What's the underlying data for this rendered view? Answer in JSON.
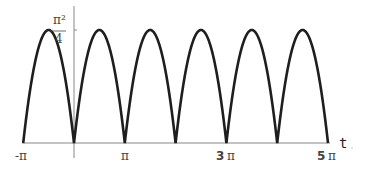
{
  "chart_data": {
    "type": "line",
    "title": "",
    "function": "periodic arches with zeros at integer multiples of pi",
    "xlabel": "t",
    "ylabel": "",
    "xlim": [
      -3.14159,
      15.70796
    ],
    "ylim": [
      0,
      2.4674
    ],
    "x_ticks": [
      {
        "value": -3.14159,
        "label": "-π"
      },
      {
        "value": 3.14159,
        "label": "π"
      },
      {
        "value": 9.42478,
        "label": "3 π"
      },
      {
        "value": 15.70796,
        "label": "5 π"
      }
    ],
    "y_ticks": [
      {
        "value": 2.4674,
        "label_num": "π²",
        "label_den": "4"
      }
    ],
    "series": [
      {
        "name": "f(t)",
        "color": "#222222",
        "zeros": [
          -3.14159,
          0,
          3.14159,
          6.28319,
          9.42478,
          12.56637,
          15.70796
        ],
        "peaks": [
          {
            "x": -1.5708,
            "y": 2.4674
          },
          {
            "x": 1.5708,
            "y": 2.4674
          },
          {
            "x": 4.7124,
            "y": 2.4674
          },
          {
            "x": 7.854,
            "y": 2.4674
          },
          {
            "x": 10.9956,
            "y": 2.4674
          },
          {
            "x": 14.1372,
            "y": 2.4674
          }
        ]
      }
    ],
    "grid": false,
    "legend": null
  },
  "labels": {
    "x_axis_var": "t",
    "tick_neg_pi": "-π",
    "tick_pi": "π",
    "tick_3pi_num": "3",
    "tick_5pi_num": "5",
    "pi": "π",
    "y_tick_num": "π²",
    "y_tick_den": "4"
  }
}
